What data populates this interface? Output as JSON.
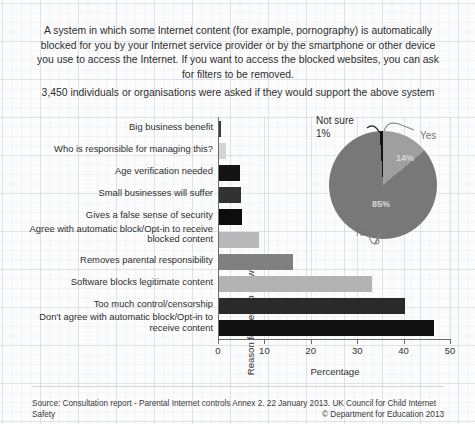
{
  "header": {
    "description": "A system in which some Internet content (for example, pornography) is automatically blocked for you by your Internet service provider or by the smartphone or other device you use to access the Internet. If you want to access the blocked websites, you can ask for filters to be removed.",
    "question": "3,450 individuals or organisations were asked if they would support the above system"
  },
  "footer": {
    "source": "Source: Consultation report - Parental Internet controls Annex 2. 22 January 2013. UK Council for Child Internet Safety",
    "copyright": "© Department for Education 2013"
  },
  "chart_data": [
    {
      "type": "bar",
      "orientation": "horizontal",
      "title": "",
      "xlabel": "Percentage",
      "ylabel": "Reason for Yes/No answer",
      "xlim": [
        0,
        50
      ],
      "xticks": [
        "0",
        "10",
        "20",
        "30",
        "40",
        "50"
      ],
      "grid": true,
      "categories": [
        "Big business benefit",
        "Who is responsible for managing this?",
        "Age verification needed",
        "Small businesses will suffer",
        "Gives a false sense of security",
        "Agree with automatic block/Opt-in to receive blocked content",
        "Removes parental responsibility",
        "Software blocks legitimate content",
        "Too much control/censorship",
        "Don't agree with automatic block/Opt-in to receive content"
      ],
      "values": [
        0.5,
        1.5,
        4.5,
        4.7,
        5.0,
        8.6,
        16.0,
        33.0,
        40.0,
        46.3
      ],
      "bar_colors": [
        "#3d3d3d",
        "#d4d4d4",
        "#141414",
        "#323232",
        "#0d0d0d",
        "#b9b9b9",
        "#808080",
        "#b3b3b3",
        "#2a2a2a",
        "#111111"
      ]
    },
    {
      "type": "pie",
      "title": "",
      "labels": [
        "Yes",
        "No",
        "Not sure"
      ],
      "values": [
        14,
        85,
        1
      ],
      "value_labels": [
        "14%",
        "85%",
        "1%"
      ],
      "slice_colors": [
        "#9f9f9f",
        "#787878",
        "#111111"
      ],
      "legend_position": "callout"
    }
  ]
}
